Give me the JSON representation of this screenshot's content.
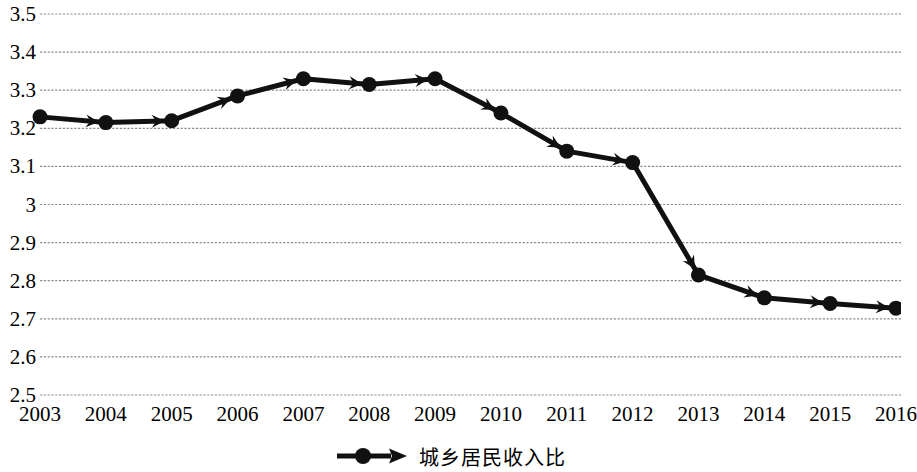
{
  "chart_data": {
    "type": "line",
    "title": "",
    "subtitle": "",
    "xlabel": "",
    "ylabel": "",
    "categories": [
      "2003",
      "2004",
      "2005",
      "2006",
      "2007",
      "2008",
      "2009",
      "2010",
      "2011",
      "2012",
      "2013",
      "2014",
      "2015",
      "2016"
    ],
    "series": [
      {
        "name": "城乡居民收入比",
        "values": [
          3.23,
          3.215,
          3.22,
          3.285,
          3.33,
          3.315,
          3.33,
          3.24,
          3.14,
          3.11,
          2.815,
          2.755,
          2.74,
          2.728
        ]
      }
    ],
    "ylim": [
      2.5,
      3.5
    ],
    "ytick_step": 0.1,
    "ytick_labels": [
      "3.5",
      "3.4",
      "3.3",
      "3.2",
      "3.1",
      "3",
      "2.9",
      "2.8",
      "2.7",
      "2.6",
      "2.5"
    ],
    "ytick_values": [
      3.5,
      3.4,
      3.3,
      3.2,
      3.1,
      3.0,
      2.9,
      2.8,
      2.7,
      2.6,
      2.5
    ],
    "grid": true,
    "grid_axis": "y",
    "grid_style": "dotted",
    "legend_position": "bottom-center",
    "marker": "circle",
    "marker_arrowheads": true,
    "colors": {
      "line": "#111111",
      "marker": "#111111",
      "grid": "#8c8c8c",
      "text": "#000000",
      "background": "#ffffff"
    }
  },
  "legend": {
    "items": [
      {
        "label": "城乡居民收入比",
        "marker_icon": "line-circle-arrow-icon",
        "color": "#111111"
      }
    ]
  }
}
